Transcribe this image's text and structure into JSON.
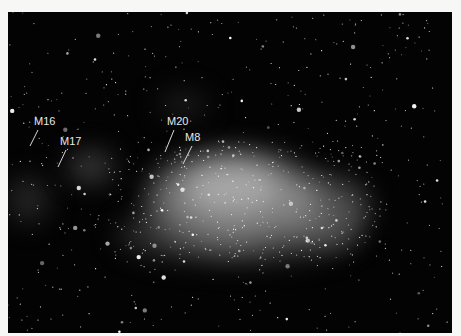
{
  "image": {
    "description": "Astronomical photograph of the Milky Way star field in Sagittarius with labeled nebulae",
    "background_color": "#f7f7f5",
    "sky_color": "#030303"
  },
  "labels": [
    {
      "id": "m16",
      "text": "M16",
      "x": 26,
      "y": 104,
      "line": {
        "x1": 30,
        "y1": 118,
        "x2": 22,
        "y2": 134
      }
    },
    {
      "id": "m17",
      "text": "M17",
      "x": 52,
      "y": 124,
      "line": {
        "x1": 58,
        "y1": 138,
        "x2": 50,
        "y2": 155
      }
    },
    {
      "id": "m20",
      "text": "M20",
      "x": 159,
      "y": 104,
      "line": {
        "x1": 166,
        "y1": 118,
        "x2": 157,
        "y2": 140
      }
    },
    {
      "id": "m8",
      "text": "M8",
      "x": 177,
      "y": 120,
      "line": {
        "x1": 184,
        "y1": 134,
        "x2": 175,
        "y2": 152
      }
    }
  ]
}
